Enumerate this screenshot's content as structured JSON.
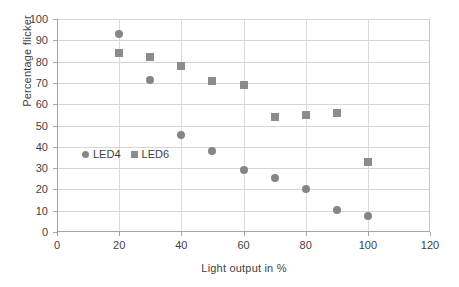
{
  "chart_data": {
    "type": "scatter",
    "title": "",
    "xlabel": "Light output in %",
    "ylabel": "Percentage flicker",
    "xlim": [
      0,
      120
    ],
    "ylim": [
      0,
      100
    ],
    "xticks": [
      0,
      20,
      40,
      60,
      80,
      100,
      120
    ],
    "yticks": [
      0,
      10,
      20,
      30,
      40,
      50,
      60,
      70,
      80,
      90,
      100
    ],
    "grid": "horizontal-and-vertical",
    "legend_position": "inside-left",
    "marker_color": "#868686",
    "series": [
      {
        "name": "LED4",
        "marker": "circle",
        "color": "#868686",
        "points": [
          {
            "x": 20,
            "y": 93
          },
          {
            "x": 30,
            "y": 71.5
          },
          {
            "x": 40,
            "y": 45.5
          },
          {
            "x": 50,
            "y": 38
          },
          {
            "x": 60,
            "y": 29
          },
          {
            "x": 70,
            "y": 25.5
          },
          {
            "x": 80,
            "y": 20
          },
          {
            "x": 90,
            "y": 10.5
          },
          {
            "x": 100,
            "y": 7.5
          }
        ]
      },
      {
        "name": "LED6",
        "marker": "square",
        "color": "#8c8c8c",
        "points": [
          {
            "x": 20,
            "y": 84
          },
          {
            "x": 30,
            "y": 82
          },
          {
            "x": 40,
            "y": 78
          },
          {
            "x": 50,
            "y": 71
          },
          {
            "x": 60,
            "y": 69
          },
          {
            "x": 70,
            "y": 54
          },
          {
            "x": 80,
            "y": 55
          },
          {
            "x": 90,
            "y": 56
          },
          {
            "x": 100,
            "y": 33
          }
        ]
      }
    ]
  },
  "legend": {
    "entries": [
      {
        "label": "LED4",
        "marker": "circle"
      },
      {
        "label": "LED6",
        "marker": "square"
      }
    ]
  }
}
